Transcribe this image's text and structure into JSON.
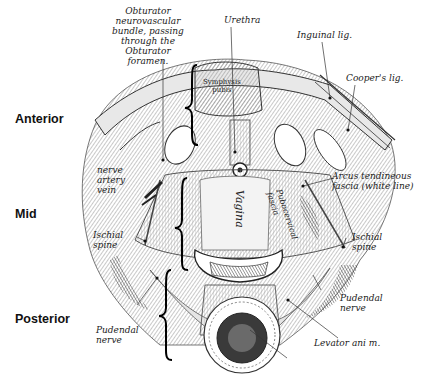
{
  "figure": {
    "type": "anatomical-illustration",
    "colors": {
      "ink": "#222222",
      "background": "#ffffff",
      "shade": "#9a9a9a",
      "dark_shade": "#3a3a3a"
    }
  },
  "regions": {
    "anterior": "Anterior",
    "mid": "Mid",
    "posterior": "Posterior"
  },
  "labels": {
    "obturator": "Obturator\nneurovascular\nbundle, passing\nthrough the\nObturator\nforamen.",
    "urethra": "Urethra",
    "inguinal": "Inguinal lig.",
    "coopers": "Cooper's lig.",
    "symphysis": "Symphysis\npubis",
    "nerve_artery_vein": "nerve\nartery\nvein",
    "arcus": "Arcus tendineous\nfascia (white line)",
    "pubocervical": "Pubocervical\nfascia",
    "vagina": "Vagina",
    "ischial_left": "Ischial\nspine",
    "ischial_right": "Ischial\nspine",
    "pudendal_left": "Pudendal\nnerve",
    "pudendal_right": "Pudendal\nnerve",
    "levator": "Levator ani m."
  }
}
